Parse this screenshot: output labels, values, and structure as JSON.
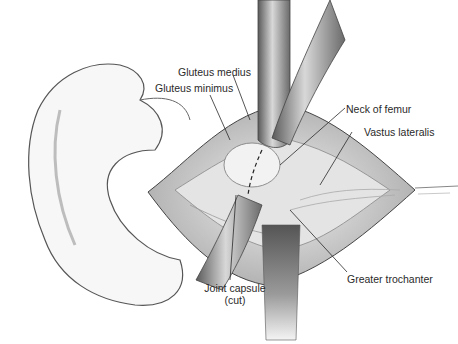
{
  "figure": {
    "colors": {
      "background": "#ffffff",
      "line": "#2a2a2a",
      "retractor": "#8a8a8a",
      "tissue": "#d6d6d6"
    }
  },
  "labels": {
    "gluteus_medius": "Gluteus medius",
    "gluteus_minimus": "Gluteus minimus",
    "neck_of_femur": "Neck of femur",
    "vastus_lateralis": "Vastus lateralis",
    "joint_capsule_line1": "Joint capsule",
    "joint_capsule_line2": "(cut)",
    "greater_trochanter": "Greater trochanter"
  }
}
